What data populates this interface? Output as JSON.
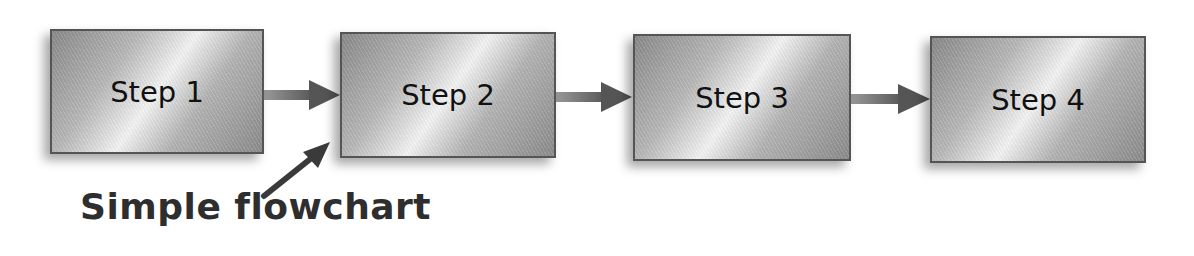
{
  "diagram": {
    "steps": [
      {
        "label": "Step 1"
      },
      {
        "label": "Step 2"
      },
      {
        "label": "Step 3"
      },
      {
        "label": "Step 4"
      }
    ],
    "connectors": [
      {
        "from": "Step 1",
        "to": "Step 2"
      },
      {
        "from": "Step 2",
        "to": "Step 3"
      },
      {
        "from": "Step 3",
        "to": "Step 4"
      }
    ],
    "caption": "Simple flowchart",
    "colors": {
      "box_border": "#555555",
      "arrow": "#5a5a5a",
      "caption_text": "#2e2e2e"
    }
  }
}
